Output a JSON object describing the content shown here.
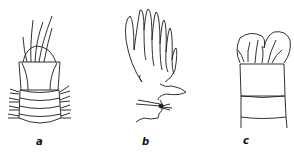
{
  "figure": {
    "panels": [
      {
        "id": "a",
        "label": "a",
        "description": "worm anterior end with retracted tentacle crown and setae on segments"
      },
      {
        "id": "b",
        "label": "b",
        "description": "branched plumose gill/tentacle structure"
      },
      {
        "id": "c",
        "label": "c",
        "description": "anterior end with bilobed cap and tentacles, segmented body"
      }
    ],
    "stroke_color": "#1a1a1a",
    "background": "#ffffff"
  }
}
